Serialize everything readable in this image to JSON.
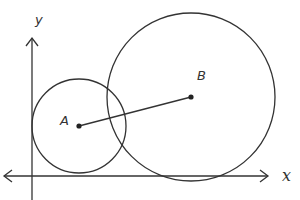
{
  "diagram": {
    "type": "coordinate-geometry",
    "axes": {
      "x_label": "x",
      "y_label": "y",
      "x_axis": {
        "y": 176,
        "from": 4,
        "to": 268,
        "arrows": [
          "left",
          "right"
        ]
      },
      "y_axis": {
        "x": 32,
        "from": 200,
        "to": 38,
        "arrows": [
          "up"
        ]
      }
    },
    "circles": [
      {
        "name": "A",
        "label": "A",
        "cx": 79,
        "cy": 126,
        "r": 47,
        "tangent_to": [
          "x-axis",
          "y-axis",
          "circle B"
        ]
      },
      {
        "name": "B",
        "label": "B",
        "cx": 191,
        "cy": 97,
        "r": 84,
        "tangent_to": [
          "x-axis",
          "circle A"
        ]
      }
    ],
    "segments": [
      {
        "from": "A",
        "to": "B",
        "description": "segment connecting centers A and B"
      }
    ],
    "colors": {
      "stroke": "#333333",
      "background": "#ffffff"
    }
  }
}
